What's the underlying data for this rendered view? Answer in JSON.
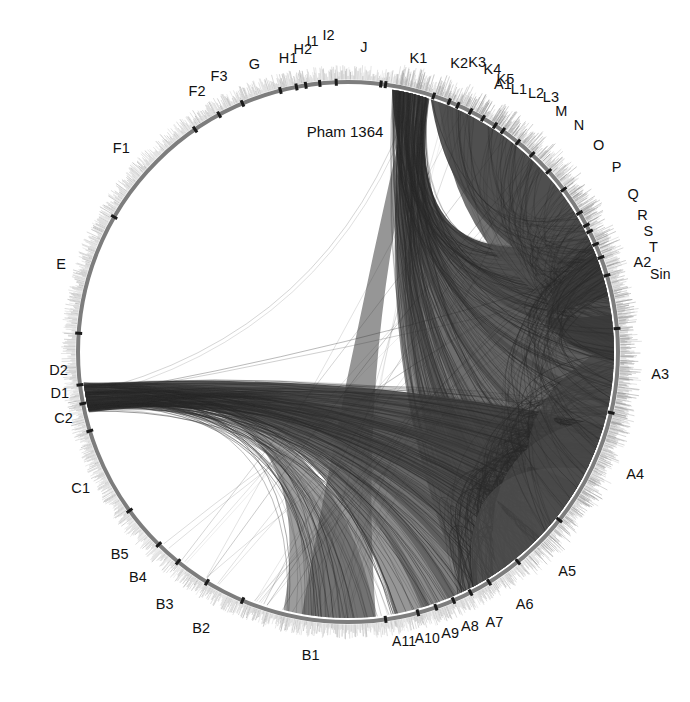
{
  "figure": {
    "kind": "circular-genome-comparison-plot",
    "title": "Pham 1364",
    "background_color": "#ffffff",
    "ring": {
      "center_x": 348,
      "center_y": 352,
      "radius": 270,
      "stroke_color": "#7d7d7d",
      "stroke_width": 4,
      "tick_color": "#b9b9b9",
      "separator_color": "#1b1b1b"
    },
    "chord": {
      "fill_color": "#4a4a4a",
      "line_color": "#2b2b2b"
    }
  },
  "chart_data": {
    "type": "chord",
    "title": "Pham 1364",
    "xlabel": "",
    "ylabel": "",
    "legend_position": "none",
    "grid": false,
    "categories": [
      "A1",
      "A2",
      "A3",
      "A4",
      "A5",
      "A6",
      "A7",
      "A8",
      "A9",
      "A10",
      "A11",
      "B1",
      "B2",
      "B3",
      "B4",
      "B5",
      "C1",
      "C2",
      "D1",
      "D2",
      "E",
      "F1",
      "F2",
      "F3",
      "G",
      "H1",
      "H2",
      "I1",
      "I2",
      "J",
      "K1",
      "K2",
      "K3",
      "K4",
      "K5",
      "L1",
      "L2",
      "L3",
      "M",
      "N",
      "O",
      "P",
      "Q",
      "R",
      "S",
      "T",
      "Sin"
    ],
    "segments": [
      {
        "label": "A1",
        "angle_deg": -60,
        "label_angle_deg": -60,
        "span_deg": 46,
        "label_radius": 310
      },
      {
        "label": "A2",
        "angle_deg": -17,
        "label_angle_deg": -17,
        "span_deg": 22,
        "label_radius": 308
      },
      {
        "label": "A3",
        "angle_deg": 4,
        "label_angle_deg": 4,
        "span_deg": 18,
        "label_radius": 313
      },
      {
        "label": "A4",
        "angle_deg": 23,
        "label_angle_deg": 23,
        "span_deg": 20,
        "label_radius": 312
      },
      {
        "label": "A5",
        "angle_deg": 45,
        "label_angle_deg": 45,
        "span_deg": 13,
        "label_radius": 310
      },
      {
        "label": "A6",
        "angle_deg": 55,
        "label_angle_deg": 55,
        "span_deg": 8,
        "label_radius": 308
      },
      {
        "label": "A7",
        "angle_deg": 61,
        "label_angle_deg": 61.5,
        "span_deg": 5,
        "label_radius": 307
      },
      {
        "label": "A8",
        "angle_deg": 65,
        "label_angle_deg": 66,
        "span_deg": 4,
        "label_radius": 300
      },
      {
        "label": "A9",
        "angle_deg": 69,
        "label_angle_deg": 70,
        "span_deg": 4,
        "label_radius": 299
      },
      {
        "label": "A10",
        "angle_deg": 73,
        "label_angle_deg": 74.5,
        "span_deg": 4,
        "label_radius": 297
      },
      {
        "label": "A11",
        "angle_deg": 77,
        "label_angle_deg": 79,
        "span_deg": 4,
        "label_radius": 294
      },
      {
        "label": "B1",
        "angle_deg": 95,
        "label_angle_deg": 97,
        "span_deg": 26,
        "label_radius": 305
      },
      {
        "label": "B2",
        "angle_deg": 117,
        "label_angle_deg": 118,
        "span_deg": 8,
        "label_radius": 313
      },
      {
        "label": "B3",
        "angle_deg": 125,
        "label_angle_deg": 126,
        "span_deg": 7,
        "label_radius": 312
      },
      {
        "label": "B4",
        "angle_deg": 132,
        "label_angle_deg": 133,
        "span_deg": 6,
        "label_radius": 308
      },
      {
        "label": "B5",
        "angle_deg": 137,
        "label_angle_deg": 138.5,
        "span_deg": 5,
        "label_radius": 305
      },
      {
        "label": "C1",
        "angle_deg": 152,
        "label_angle_deg": 153,
        "span_deg": 16,
        "label_radius": 300
      },
      {
        "label": "C2",
        "angle_deg": 166,
        "label_angle_deg": 167,
        "span_deg": 6,
        "label_radius": 292
      },
      {
        "label": "D1",
        "angle_deg": 171,
        "label_angle_deg": 172,
        "span_deg": 4,
        "label_radius": 291
      },
      {
        "label": "D2",
        "angle_deg": 175,
        "label_angle_deg": 176.5,
        "span_deg": 4,
        "label_radius": 290
      },
      {
        "label": "E",
        "angle_deg": 196,
        "label_angle_deg": 197,
        "span_deg": 24,
        "label_radius": 300
      },
      {
        "label": "F1",
        "angle_deg": 222,
        "label_angle_deg": 222,
        "span_deg": 24,
        "label_radius": 305
      },
      {
        "label": "F2",
        "angle_deg": 239,
        "label_angle_deg": 240,
        "span_deg": 7,
        "label_radius": 302
      },
      {
        "label": "F3",
        "angle_deg": 244,
        "label_angle_deg": 245,
        "span_deg": 5,
        "label_radius": 305
      },
      {
        "label": "G",
        "angle_deg": 251,
        "label_angle_deg": 252,
        "span_deg": 8,
        "label_radius": 303
      },
      {
        "label": "H1",
        "angle_deg": 258,
        "label_angle_deg": 258.5,
        "span_deg": 5,
        "label_radius": 300
      },
      {
        "label": "H2",
        "angle_deg": 261,
        "label_angle_deg": 261.5,
        "span_deg": 4,
        "label_radius": 306
      },
      {
        "label": "I1",
        "angle_deg": 263,
        "label_angle_deg": 263.5,
        "span_deg": 4,
        "label_radius": 313
      },
      {
        "label": "I2",
        "angle_deg": 266,
        "label_angle_deg": 266.5,
        "span_deg": 4,
        "label_radius": 318
      },
      {
        "label": "J",
        "angle_deg": 272,
        "label_angle_deg": 273,
        "span_deg": 9,
        "label_radius": 305
      },
      {
        "label": "K1",
        "angle_deg": 283,
        "label_angle_deg": 283.5,
        "span_deg": 10,
        "label_radius": 302
      },
      {
        "label": "K2",
        "angle_deg": 291,
        "label_angle_deg": 291,
        "span_deg": 5,
        "label_radius": 310
      },
      {
        "label": "K3",
        "angle_deg": 294,
        "label_angle_deg": 294,
        "span_deg": 4,
        "label_radius": 318
      },
      {
        "label": "K4",
        "angle_deg": 296,
        "label_angle_deg": 297,
        "span_deg": 4,
        "label_radius": 318
      },
      {
        "label": "K5",
        "angle_deg": 299,
        "label_angle_deg": 300,
        "span_deg": 4,
        "label_radius": 315
      },
      {
        "label": "L1",
        "angle_deg": 302,
        "label_angle_deg": 303,
        "span_deg": 4,
        "label_radius": 314
      },
      {
        "label": "L2",
        "angle_deg": 305,
        "label_angle_deg": 306,
        "span_deg": 4,
        "label_radius": 320
      },
      {
        "label": "L3",
        "angle_deg": 307,
        "label_angle_deg": 308.5,
        "span_deg": 4,
        "label_radius": 326
      },
      {
        "label": "M",
        "angle_deg": 311,
        "label_angle_deg": 311.5,
        "span_deg": 4,
        "label_radius": 322
      },
      {
        "label": "N",
        "angle_deg": 315,
        "label_angle_deg": 315.5,
        "span_deg": 4,
        "label_radius": 324
      },
      {
        "label": "O",
        "angle_deg": 320,
        "label_angle_deg": 320.5,
        "span_deg": 4,
        "label_radius": 325
      },
      {
        "label": "P",
        "angle_deg": 325,
        "label_angle_deg": 325.5,
        "span_deg": 4,
        "label_radius": 326
      },
      {
        "label": "Q",
        "angle_deg": 331,
        "label_angle_deg": 331,
        "span_deg": 4,
        "label_radius": 326
      },
      {
        "label": "R",
        "angle_deg": 335,
        "label_angle_deg": 335,
        "span_deg": 3,
        "label_radius": 325
      },
      {
        "label": "S",
        "angle_deg": 338,
        "label_angle_deg": 338,
        "span_deg": 3,
        "label_radius": 324
      },
      {
        "label": "T",
        "angle_deg": 341,
        "label_angle_deg": 341,
        "span_deg": 3,
        "label_radius": 323
      },
      {
        "label": "Sin",
        "angle_deg": 346,
        "label_angle_deg": 346,
        "span_deg": 5,
        "label_radius": 322
      }
    ],
    "hubs": [
      {
        "name": "K1",
        "x": 170,
        "y": 155
      },
      {
        "name": "D1",
        "x": 146,
        "y": 551
      },
      {
        "name": "A2",
        "x": 565,
        "y": 195
      },
      {
        "name": "A5",
        "x": 592,
        "y": 487
      }
    ],
    "chord_bundles": [
      {
        "from": "K1",
        "to": "A2",
        "weight": "heavy"
      },
      {
        "from": "K1",
        "to": "A3",
        "weight": "heavy"
      },
      {
        "from": "K1",
        "to": "A4",
        "weight": "heavy"
      },
      {
        "from": "K1",
        "to": "A5",
        "weight": "heavy"
      },
      {
        "from": "K1",
        "to": "A6",
        "weight": "medium"
      },
      {
        "from": "K1",
        "to": "B1",
        "weight": "medium"
      },
      {
        "from": "D1",
        "to": "A4",
        "weight": "heavy"
      },
      {
        "from": "D1",
        "to": "A5",
        "weight": "heavy"
      },
      {
        "from": "D1",
        "to": "A6",
        "weight": "heavy"
      },
      {
        "from": "D1",
        "to": "A8",
        "weight": "medium"
      },
      {
        "from": "D1",
        "to": "A11",
        "weight": "medium"
      },
      {
        "from": "D1",
        "to": "B1",
        "weight": "light"
      },
      {
        "from": "K1",
        "to": "D1",
        "weight": "light"
      },
      {
        "from": "A2",
        "to": "A5",
        "weight": "medium"
      }
    ]
  }
}
